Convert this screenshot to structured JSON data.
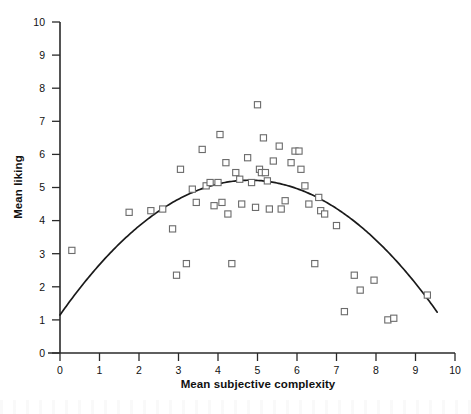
{
  "chart_data": {
    "type": "scatter",
    "title": "",
    "xlabel": "Mean subjective complexity",
    "ylabel": "Mean liking",
    "xlim": [
      0,
      10
    ],
    "ylim": [
      0,
      10
    ],
    "xticks": [
      0,
      1,
      2,
      3,
      4,
      5,
      6,
      7,
      8,
      9,
      10
    ],
    "yticks": [
      0,
      1,
      2,
      3,
      4,
      5,
      6,
      7,
      8,
      9,
      10
    ],
    "xtick_labels": [
      "0",
      "1",
      "2",
      "3",
      "4",
      "5",
      "6",
      "7",
      "8",
      "9",
      "10"
    ],
    "ytick_labels": [
      "0",
      "1",
      "2",
      "3",
      "4",
      "5",
      "6",
      "7",
      "8",
      "9",
      "10"
    ],
    "grid": false,
    "legend": null,
    "marker_style": "open-square",
    "points": [
      [
        0.3,
        3.1
      ],
      [
        1.75,
        4.25
      ],
      [
        2.3,
        4.3
      ],
      [
        2.6,
        4.35
      ],
      [
        2.85,
        3.75
      ],
      [
        2.95,
        2.35
      ],
      [
        3.05,
        5.55
      ],
      [
        3.2,
        2.7
      ],
      [
        3.35,
        4.95
      ],
      [
        3.45,
        4.55
      ],
      [
        3.6,
        6.15
      ],
      [
        3.7,
        5.05
      ],
      [
        3.8,
        5.15
      ],
      [
        3.9,
        4.45
      ],
      [
        4.0,
        5.15
      ],
      [
        4.05,
        6.6
      ],
      [
        4.1,
        4.55
      ],
      [
        4.2,
        5.75
      ],
      [
        4.25,
        4.2
      ],
      [
        4.35,
        2.7
      ],
      [
        4.45,
        5.45
      ],
      [
        4.55,
        5.25
      ],
      [
        4.6,
        4.5
      ],
      [
        4.75,
        5.9
      ],
      [
        4.85,
        5.15
      ],
      [
        4.95,
        4.4
      ],
      [
        5.0,
        7.5
      ],
      [
        5.05,
        5.55
      ],
      [
        5.1,
        5.45
      ],
      [
        5.15,
        6.5
      ],
      [
        5.2,
        5.45
      ],
      [
        5.25,
        5.2
      ],
      [
        5.3,
        4.35
      ],
      [
        5.4,
        5.8
      ],
      [
        5.55,
        6.25
      ],
      [
        5.6,
        4.35
      ],
      [
        5.7,
        4.6
      ],
      [
        5.85,
        5.75
      ],
      [
        5.95,
        6.1
      ],
      [
        6.05,
        6.1
      ],
      [
        6.1,
        5.55
      ],
      [
        6.2,
        5.05
      ],
      [
        6.3,
        4.5
      ],
      [
        6.45,
        2.7
      ],
      [
        6.55,
        4.7
      ],
      [
        6.6,
        4.3
      ],
      [
        6.7,
        4.2
      ],
      [
        7.0,
        3.85
      ],
      [
        7.2,
        1.25
      ],
      [
        7.45,
        2.35
      ],
      [
        7.6,
        1.9
      ],
      [
        7.95,
        2.2
      ],
      [
        8.3,
        1.0
      ],
      [
        8.45,
        1.05
      ],
      [
        9.3,
        1.75
      ]
    ],
    "fit": {
      "kind": "quadratic",
      "description": "inverted-U curve fitted through the scatter",
      "vertex": [
        4.8,
        5.22
      ],
      "y_at_x0": 1.15,
      "x_right_root": 9.55
    }
  },
  "caption": ""
}
